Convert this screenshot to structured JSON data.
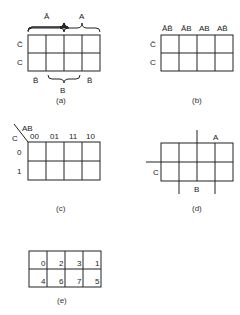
{
  "figures": {
    "a": {
      "caption": "(a)",
      "top_labels": [
        "Ā",
        "A"
      ],
      "row_labels": [
        "C̄",
        "C"
      ],
      "bottom_labels": [
        "B̄",
        "B",
        "B̄"
      ]
    },
    "b": {
      "caption": "(b)",
      "column_headers": [
        "ĀB̄",
        "ĀB",
        "AB",
        "AB̄"
      ],
      "row_labels": [
        "C̄",
        "C"
      ]
    },
    "c": {
      "caption": "(c)",
      "corner_top": "AB",
      "corner_left": "C",
      "column_headers": [
        "00",
        "01",
        "11",
        "10"
      ],
      "row_labels": [
        "0",
        "1"
      ]
    },
    "d": {
      "caption": "(d)",
      "label_a": "A",
      "label_b": "B",
      "label_c": "C"
    },
    "e": {
      "caption": "(e)",
      "cells": [
        [
          "0",
          "2",
          "3",
          "1"
        ],
        [
          "4",
          "6",
          "7",
          "5"
        ]
      ]
    }
  }
}
